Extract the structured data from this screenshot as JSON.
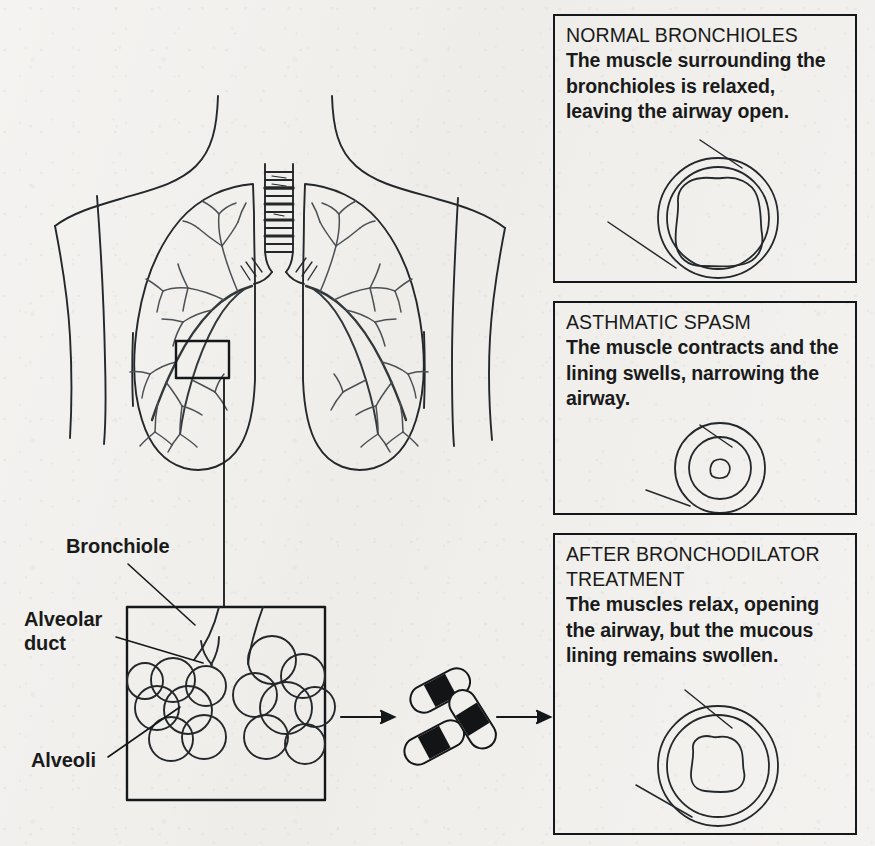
{
  "figure": {
    "background_color": "#f0efec",
    "ink_color": "#15181a"
  },
  "anatomy": {
    "torso_label": "human-torso-outline",
    "lungs_label": "lungs-with-bronchial-tree",
    "trachea_label": "trachea-with-cartilage-rings",
    "callout_box_label": "lung-detail-callout-box",
    "connector_label": "callout-connector-line"
  },
  "detail_box": {
    "name": "alveoli-detail-box",
    "labels": [
      {
        "id": "bronchiole",
        "text": "Bronchiole"
      },
      {
        "id": "alveolar-duct",
        "text": "Alveolar\nduct"
      },
      {
        "id": "alveoli",
        "text": "Alveoli"
      }
    ]
  },
  "flow": {
    "arrow_1": "arrow-right",
    "medication": "bronchodilator-capsules",
    "capsule_count": 3,
    "arrow_2": "arrow-right"
  },
  "panels": [
    {
      "id": "normal-bronchioles",
      "title": "NORMAL BRONCHIOLES",
      "body": "The muscle surrounding the\nbronchioles is relaxed,\nleaving the airway open.",
      "diagram": "bronchiole-cross-section-open",
      "lumen": "wide-open-lumen"
    },
    {
      "id": "asthmatic-spasm",
      "title": "ASTHMATIC SPASM",
      "body": "The muscle contracts and the\nlining swells, narrowing the\nairway.",
      "diagram": "bronchiole-cross-section-constricted",
      "lumen": "narrow-constricted-lumen"
    },
    {
      "id": "after-bronchodilator-treatment",
      "title": "AFTER BRONCHODILATOR\nTREATMENT",
      "body": "The muscles relax, opening\nthe airway, but the mucous\nlining remains swollen.",
      "diagram": "bronchiole-cross-section-partially-open",
      "lumen": "small-open-lumen"
    }
  ]
}
